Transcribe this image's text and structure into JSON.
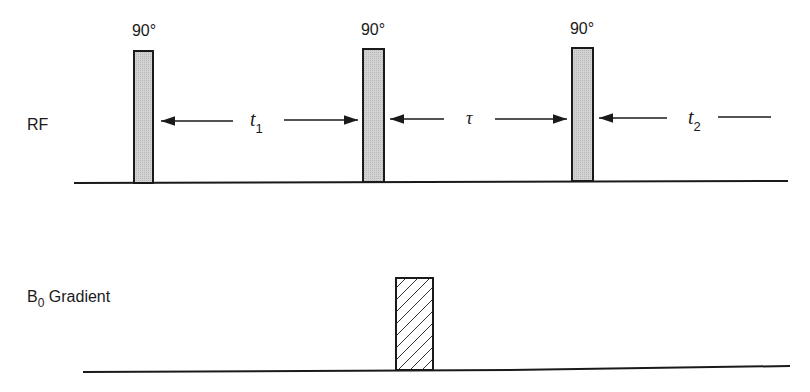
{
  "rows": {
    "rf": {
      "label": "RF"
    },
    "gradient": {
      "label_main": "B",
      "label_sub": "0",
      "label_rest": " Gradient"
    }
  },
  "pulses": [
    {
      "label": "90°",
      "x": 134,
      "width": 20
    },
    {
      "label": "90°",
      "x": 363,
      "width": 21
    },
    {
      "label": "90°",
      "x": 572,
      "width": 21
    }
  ],
  "intervals": {
    "t1": {
      "symbol": "t",
      "subscript": "1"
    },
    "tau": {
      "symbol": "τ"
    },
    "t2": {
      "symbol": "t",
      "subscript": "2"
    }
  },
  "gradient_pulse": {
    "x": 396,
    "width": 37,
    "fill": "hatched"
  },
  "colors": {
    "line": "#1a1a1a",
    "pulse_fill": "#c8c8c8",
    "background": "#ffffff"
  }
}
